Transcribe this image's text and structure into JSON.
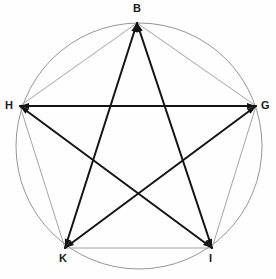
{
  "figure": {
    "type": "geometric-diagram",
    "background_color": "#fefefe",
    "canvas": {
      "width": 276,
      "height": 279
    },
    "circle": {
      "name": "circumscribed-circle",
      "cx": 139,
      "cy": 146,
      "r": 123,
      "stroke": "#8a8a8a",
      "stroke_width": 0.9,
      "fill": "none"
    },
    "vertices": [
      {
        "id": "B",
        "label": "B",
        "x": 137,
        "y": 23,
        "label_x": 133,
        "label_y": 3,
        "position": "top"
      },
      {
        "id": "G",
        "label": "G",
        "x": 256,
        "y": 106,
        "label_x": 261,
        "label_y": 100,
        "position": "right"
      },
      {
        "id": "I",
        "label": "I",
        "x": 212,
        "y": 248,
        "label_x": 209,
        "label_y": 253,
        "position": "bottom-right"
      },
      {
        "id": "K",
        "label": "K",
        "x": 65,
        "y": 248,
        "label_x": 59,
        "label_y": 253,
        "position": "bottom-left"
      },
      {
        "id": "H",
        "label": "H",
        "x": 20,
        "y": 106,
        "label_x": 5,
        "label_y": 100,
        "position": "left"
      }
    ],
    "star_chords": [
      {
        "name": "chord-B-I",
        "from": "B",
        "to": "I",
        "stroke": "#141414",
        "stroke_width": 2.0
      },
      {
        "name": "chord-I-H",
        "from": "I",
        "to": "H",
        "stroke": "#141414",
        "stroke_width": 2.0
      },
      {
        "name": "chord-H-G",
        "from": "H",
        "to": "G",
        "stroke": "#141414",
        "stroke_width": 2.0
      },
      {
        "name": "chord-G-K",
        "from": "G",
        "to": "K",
        "stroke": "#141414",
        "stroke_width": 2.0
      },
      {
        "name": "chord-K-B",
        "from": "K",
        "to": "B",
        "stroke": "#141414",
        "stroke_width": 2.0
      }
    ],
    "pentagon_edges": [
      {
        "name": "edge-B-G",
        "from": "B",
        "to": "G",
        "stroke": "#9a9a9a",
        "stroke_width": 0.9
      },
      {
        "name": "edge-G-I",
        "from": "G",
        "to": "I",
        "stroke": "#9a9a9a",
        "stroke_width": 0.9
      },
      {
        "name": "edge-I-K",
        "from": "I",
        "to": "K",
        "stroke": "#9a9a9a",
        "stroke_width": 0.9
      },
      {
        "name": "edge-K-H",
        "from": "K",
        "to": "H",
        "stroke": "#9a9a9a",
        "stroke_width": 0.9
      },
      {
        "name": "edge-H-B",
        "from": "H",
        "to": "B",
        "stroke": "#9a9a9a",
        "stroke_width": 0.9
      }
    ],
    "arrowheads": {
      "present": true,
      "description": "short filled triangular arrowheads where the dark chords meet each vertex",
      "color": "#141414",
      "length": 9,
      "half_width": 3.0
    },
    "intersections": [
      {
        "name": "inner-crossing-lower",
        "x": 139,
        "y": 197
      }
    ],
    "colors": {
      "stroke_dark": "#141414",
      "stroke_light": "#9a9a9a",
      "circle_stroke": "#8a8a8a",
      "label_color": "#1a1a1a",
      "background": "#fefefe"
    }
  }
}
